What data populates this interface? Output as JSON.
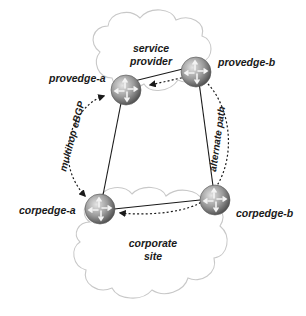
{
  "clouds": {
    "provider": {
      "line1": "service",
      "line2": "provider"
    },
    "corporate": {
      "line1": "corporate",
      "line2": "site"
    }
  },
  "routers": {
    "provedge_a": {
      "label": "provedge-a"
    },
    "provedge_b": {
      "label": "provedge-b"
    },
    "corpedge_a": {
      "label": "corpedge-a"
    },
    "corpedge_b": {
      "label": "corpedge-b"
    }
  },
  "paths": {
    "multihop": {
      "label": "multihop eBGP"
    },
    "alternate": {
      "label": "alternate path"
    }
  },
  "colors": {
    "cloud_outline": "#c8c8c8",
    "link": "#1a1a1a",
    "router_light": "#d8d8d8",
    "router_dark": "#5a5a5a"
  }
}
